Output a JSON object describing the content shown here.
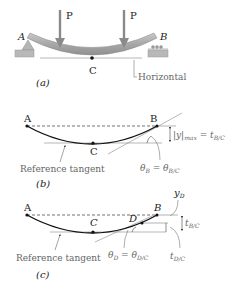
{
  "figure": {
    "panel_a": {
      "caption": "(a)",
      "labels": {
        "A": "A",
        "B": "B",
        "C": "C",
        "P1": "P",
        "P2": "P",
        "horizontal": "Horizontal"
      }
    },
    "panel_b": {
      "caption": "(b)",
      "labels": {
        "A": "A",
        "B": "B",
        "C": "C",
        "reference_tangent": "Reference tangent",
        "ymax_eq": "|y|max = tB/C",
        "theta_eq": "θB = θB/C"
      }
    },
    "panel_c": {
      "caption": "(c)",
      "labels": {
        "A": "A",
        "B": "B",
        "C": "C",
        "D": "D",
        "yD": "yD",
        "tBC": "tB/C",
        "tDC": "tD/C",
        "reference_tangent": "Reference tangent",
        "theta_eq": "θD = θD/C"
      }
    }
  },
  "colors": {
    "beam": "#a9a9a9",
    "arrow": "#8a8a8a",
    "support": "#b5b5b5",
    "curve": "#111111",
    "grey_text": "#777777"
  }
}
